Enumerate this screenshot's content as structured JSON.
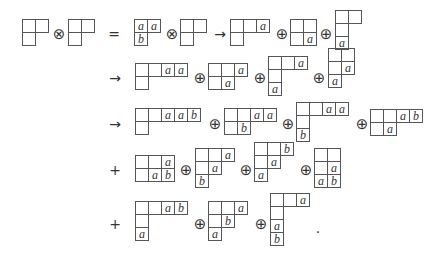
{
  "cell_size": 14,
  "tableaux": [
    {
      "id": "r1-lhs-1",
      "x": 22,
      "y": 19,
      "rows": [
        [
          null,
          null
        ],
        [
          null
        ]
      ]
    },
    {
      "id": "r1-lhs-2",
      "x": 68,
      "y": 19,
      "rows": [
        [
          null,
          null
        ],
        [
          null
        ]
      ]
    },
    {
      "id": "r1-aab",
      "x": 134,
      "y": 19,
      "rows": [
        [
          "a",
          "a"
        ],
        [
          "b"
        ]
      ]
    },
    {
      "id": "r1-empty",
      "x": 180,
      "y": 19,
      "rows": [
        [
          null,
          null
        ],
        [
          null
        ]
      ]
    },
    {
      "id": "r1-t1",
      "x": 230,
      "y": 19,
      "rows": [
        [
          null,
          null,
          "a"
        ],
        [
          null
        ]
      ]
    },
    {
      "id": "r1-t2",
      "x": 290,
      "y": 19,
      "rows": [
        [
          null,
          null
        ],
        [
          null,
          "a"
        ]
      ]
    },
    {
      "id": "r1-t3",
      "x": 335,
      "y": 10,
      "rows": [
        [
          null,
          null
        ],
        [
          null
        ],
        [
          "a"
        ]
      ]
    },
    {
      "id": "r2-t1",
      "x": 135,
      "y": 63,
      "rows": [
        [
          null,
          null,
          "a",
          "a"
        ],
        [
          null
        ]
      ]
    },
    {
      "id": "r2-t2",
      "x": 208,
      "y": 63,
      "rows": [
        [
          null,
          null,
          "a"
        ],
        [
          null,
          "a"
        ]
      ]
    },
    {
      "id": "r2-t3",
      "x": 268,
      "y": 56,
      "rows": [
        [
          null,
          null,
          "a"
        ],
        [
          null
        ],
        [
          "a"
        ]
      ]
    },
    {
      "id": "r2-t4",
      "x": 328,
      "y": 48,
      "rows": [
        [
          null,
          null
        ],
        [
          null,
          "a"
        ],
        [
          "a"
        ]
      ]
    },
    {
      "id": "r3-t1",
      "x": 135,
      "y": 108,
      "rows": [
        [
          null,
          null,
          "a",
          "a",
          "b"
        ],
        [
          null
        ]
      ]
    },
    {
      "id": "r3-t2",
      "x": 224,
      "y": 108,
      "rows": [
        [
          null,
          null,
          "a",
          "a"
        ],
        [
          null,
          "b"
        ]
      ]
    },
    {
      "id": "r3-t3",
      "x": 296,
      "y": 102,
      "rows": [
        [
          null,
          null,
          "a",
          "a"
        ],
        [
          null
        ],
        [
          "b"
        ]
      ]
    },
    {
      "id": "r3-t4",
      "x": 370,
      "y": 109,
      "rows": [
        [
          null,
          null,
          "a",
          "b"
        ],
        [
          null,
          "a"
        ]
      ]
    },
    {
      "id": "r4-t1",
      "x": 135,
      "y": 155,
      "rows": [
        [
          null,
          null,
          "a"
        ],
        [
          null,
          "a",
          "b"
        ]
      ]
    },
    {
      "id": "r4-t2",
      "x": 195,
      "y": 148,
      "rows": [
        [
          null,
          null,
          "a"
        ],
        [
          null,
          "a"
        ],
        [
          "b"
        ]
      ]
    },
    {
      "id": "r4-t3",
      "x": 254,
      "y": 142,
      "rows": [
        [
          null,
          null,
          "b"
        ],
        [
          null,
          "a"
        ],
        [
          "a"
        ]
      ]
    },
    {
      "id": "r4-t4",
      "x": 314,
      "y": 148,
      "rows": [
        [
          null,
          null
        ],
        [
          null,
          "a"
        ],
        [
          "a",
          "b"
        ]
      ]
    },
    {
      "id": "r5-t1",
      "x": 135,
      "y": 201,
      "rows": [
        [
          null,
          null,
          "a",
          "b"
        ],
        [
          null
        ],
        [
          "a"
        ]
      ]
    },
    {
      "id": "r5-t2",
      "x": 208,
      "y": 201,
      "rows": [
        [
          null,
          null,
          "a"
        ],
        [
          null,
          "b"
        ],
        [
          "a"
        ]
      ]
    },
    {
      "id": "r5-t3",
      "x": 270,
      "y": 193,
      "rows": [
        [
          null,
          null,
          "a"
        ],
        [
          null
        ],
        [
          "a"
        ],
        [
          "b"
        ]
      ]
    }
  ],
  "symbols": [
    {
      "id": "otimes-1",
      "x": 59,
      "y": 34,
      "text": "⊗"
    },
    {
      "id": "equals",
      "x": 114,
      "y": 34,
      "text": "="
    },
    {
      "id": "otimes-2",
      "x": 172,
      "y": 34,
      "text": "⊗"
    },
    {
      "id": "arrow-1",
      "x": 220,
      "y": 34,
      "text": "→"
    },
    {
      "id": "oplus-1",
      "x": 282,
      "y": 34,
      "text": "⊕"
    },
    {
      "id": "oplus-2",
      "x": 326,
      "y": 34,
      "text": "⊕"
    },
    {
      "id": "arrow-2",
      "x": 115,
      "y": 78,
      "text": "→"
    },
    {
      "id": "oplus-3",
      "x": 200,
      "y": 78,
      "text": "⊕"
    },
    {
      "id": "oplus-4",
      "x": 260,
      "y": 78,
      "text": "⊕"
    },
    {
      "id": "oplus-5",
      "x": 319,
      "y": 78,
      "text": "⊕"
    },
    {
      "id": "arrow-3",
      "x": 115,
      "y": 124,
      "text": "→"
    },
    {
      "id": "oplus-6",
      "x": 215,
      "y": 124,
      "text": "⊕"
    },
    {
      "id": "oplus-7",
      "x": 288,
      "y": 124,
      "text": "⊕"
    },
    {
      "id": "oplus-8",
      "x": 362,
      "y": 124,
      "text": "⊕"
    },
    {
      "id": "plus-1",
      "x": 115,
      "y": 170,
      "text": "+"
    },
    {
      "id": "oplus-9",
      "x": 186,
      "y": 170,
      "text": "⊕"
    },
    {
      "id": "oplus-10",
      "x": 246,
      "y": 170,
      "text": "⊕"
    },
    {
      "id": "oplus-11",
      "x": 306,
      "y": 170,
      "text": "⊕"
    },
    {
      "id": "plus-2",
      "x": 115,
      "y": 224,
      "text": "+"
    },
    {
      "id": "oplus-12",
      "x": 200,
      "y": 224,
      "text": "⊕"
    },
    {
      "id": "oplus-13",
      "x": 261,
      "y": 224,
      "text": "⊕"
    },
    {
      "id": "period",
      "x": 318,
      "y": 228,
      "text": "."
    }
  ]
}
